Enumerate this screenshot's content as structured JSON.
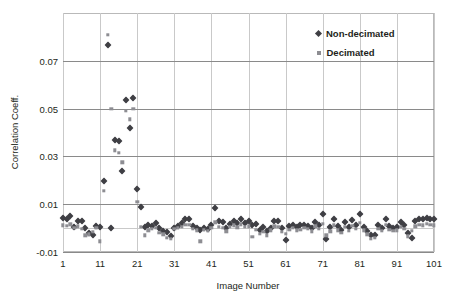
{
  "chart_data": {
    "type": "scatter",
    "title": "",
    "xlabel": "Image Number",
    "ylabel": "Correlation Coeff.",
    "xlim": [
      1,
      101
    ],
    "ylim": [
      -0.01,
      0.09
    ],
    "xticks": [
      1,
      11,
      21,
      31,
      41,
      51,
      61,
      71,
      81,
      91,
      101
    ],
    "xticklabels": [
      "1",
      "11",
      "21",
      "31",
      "41",
      "51",
      "61",
      "71",
      "81",
      "91",
      "101"
    ],
    "yticks": [
      -0.01,
      0.01,
      0.03,
      0.05,
      0.07
    ],
    "yticklabels": [
      "-0.01",
      "0.01",
      "0.03",
      "0.05",
      "0.07"
    ],
    "grid": "both",
    "legend_position": "top-right",
    "series": [
      {
        "name": "Non-decimated",
        "marker": "diamond",
        "color": "#3f3f44",
        "x": [
          1,
          2,
          3,
          4,
          5,
          6,
          7,
          8,
          9,
          10,
          11,
          12,
          13,
          14,
          15,
          16,
          17,
          18,
          19,
          20,
          21,
          22,
          23,
          24,
          25,
          26,
          27,
          28,
          29,
          30,
          31,
          32,
          33,
          34,
          35,
          36,
          37,
          38,
          39,
          40,
          41,
          42,
          43,
          44,
          45,
          46,
          47,
          48,
          49,
          50,
          51,
          52,
          53,
          54,
          55,
          56,
          57,
          58,
          59,
          60,
          61,
          62,
          63,
          64,
          65,
          66,
          67,
          68,
          69,
          70,
          71,
          72,
          73,
          74,
          75,
          76,
          77,
          78,
          79,
          80,
          81,
          82,
          83,
          84,
          85,
          86,
          87,
          88,
          89,
          90,
          91,
          92,
          93,
          94,
          95,
          96,
          97,
          98,
          99,
          100,
          101
        ],
        "y": [
          0.0042,
          0.004,
          0.0052,
          0.0005,
          0.003,
          0.0028,
          0.0,
          -0.002,
          -0.0028,
          0.001,
          0.0005,
          0.0195,
          0.0765,
          0.0002,
          0.037,
          0.0365,
          0.024,
          0.0535,
          0.042,
          0.0545,
          0.0165,
          0.0088,
          0.0005,
          0.0012,
          0.001,
          0.0022,
          0.0,
          -0.0014,
          -0.0016,
          -0.0032,
          0.0,
          0.0008,
          0.002,
          0.0038,
          0.0038,
          0.001,
          0.0002,
          -0.0006,
          0.0002,
          -0.0004,
          0.0012,
          0.0086,
          0.003,
          0.0024,
          0.0,
          0.0018,
          0.003,
          0.002,
          0.004,
          0.0022,
          0.0028,
          0.0012,
          0.0016,
          -0.001,
          0.0006,
          -0.0012,
          0.0,
          0.003,
          0.0028,
          0.0002,
          -0.0048,
          0.0008,
          0.0012,
          0.0004,
          0.0012,
          0.0012,
          0.001,
          0.0,
          0.0024,
          0.0012,
          0.006,
          -0.0046,
          0.0004,
          0.0038,
          0.0008,
          -0.0006,
          0.0024,
          0.0004,
          0.0032,
          0.0014,
          0.006,
          0.0006,
          -0.0014,
          -0.003,
          -0.0028,
          0.0014,
          0.0,
          0.0038,
          0.001,
          0.0002,
          0.0006,
          0.0026,
          0.0012,
          -0.0022,
          -0.004,
          0.0028,
          0.004,
          0.0038,
          0.0044,
          0.004,
          0.0036
        ]
      },
      {
        "name": "Decimated",
        "marker": "square",
        "color": "#8d8d92",
        "x": [
          1,
          2,
          3,
          4,
          5,
          6,
          7,
          8,
          9,
          10,
          11,
          12,
          13,
          14,
          15,
          16,
          17,
          18,
          19,
          20,
          21,
          22,
          23,
          24,
          25,
          26,
          27,
          28,
          29,
          30,
          31,
          32,
          33,
          34,
          35,
          36,
          37,
          38,
          39,
          40,
          41,
          42,
          43,
          44,
          45,
          46,
          47,
          48,
          49,
          50,
          51,
          52,
          53,
          54,
          55,
          56,
          57,
          58,
          59,
          60,
          61,
          62,
          63,
          64,
          65,
          66,
          67,
          68,
          69,
          70,
          71,
          72,
          73,
          74,
          75,
          76,
          77,
          78,
          79,
          80,
          81,
          82,
          83,
          84,
          85,
          86,
          87,
          88,
          89,
          90,
          91,
          92,
          93,
          94,
          95,
          96,
          97,
          98,
          99,
          100,
          101
        ],
        "y": [
          0.0012,
          0.001,
          0.0016,
          0.0,
          0.0008,
          -0.0004,
          -0.003,
          -0.0026,
          -0.0016,
          0.0,
          -0.0056,
          0.0155,
          0.081,
          0.05,
          0.0325,
          0.0315,
          0.0275,
          0.049,
          0.0455,
          0.05,
          0.011,
          0.0006,
          -0.003,
          -0.001,
          -0.0004,
          0.0,
          -0.002,
          -0.0026,
          -0.004,
          -0.0046,
          -0.0004,
          0.0,
          0.0006,
          0.0014,
          0.0014,
          -0.0002,
          -0.001,
          -0.0056,
          -0.0008,
          -0.0012,
          0.0,
          0.0024,
          0.0006,
          0.0,
          -0.0014,
          0.0006,
          0.0012,
          0.0004,
          0.0016,
          0.0006,
          0.0008,
          -0.0036,
          -0.0006,
          -0.0024,
          -0.0016,
          -0.003,
          -0.001,
          0.0008,
          0.0006,
          -0.0016,
          -0.0024,
          -0.0008,
          0.0,
          -0.001,
          -0.0006,
          0.0,
          -0.0004,
          -0.0014,
          0.0008,
          -0.0004,
          0.0018,
          -0.003,
          -0.0014,
          0.0012,
          -0.001,
          -0.002,
          0.0006,
          -0.0012,
          0.001,
          -0.0004,
          0.0022,
          -0.001,
          -0.0026,
          -0.0044,
          -0.004,
          -0.0004,
          -0.0012,
          0.0014,
          -0.0006,
          -0.0012,
          -0.001,
          0.0006,
          -0.0004,
          -0.0034,
          -0.0012,
          0.0008,
          0.0014,
          0.0012,
          0.0018,
          0.0014,
          0.0012
        ]
      }
    ]
  },
  "legend": {
    "items": [
      {
        "label": "Non-decimated",
        "marker": "diamond"
      },
      {
        "label": "Decimated",
        "marker": "square"
      }
    ]
  }
}
